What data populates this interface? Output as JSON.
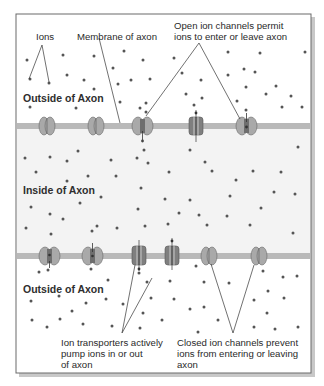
{
  "diagram": {
    "regions": {
      "outside_top": "Outside of Axon",
      "inside": "Inside of Axon",
      "outside_bottom": "Outside of Axon"
    },
    "labels": {
      "ions": "Ions",
      "membrane": "Membrane of axon",
      "open_channels_line1": "Open ion channels permit",
      "open_channels_line2": "ions to enter or leave axon",
      "transporters_line1": "Ion transporters actively",
      "transporters_line2": "pump ions in or out",
      "transporters_line3": "of axon",
      "closed_channels_line1": "Closed ion channels prevent",
      "closed_channels_line2": "ions from entering or leaving",
      "closed_channels_line3": "axon"
    },
    "top_membrane_proteins": [
      {
        "type": "closed-channel",
        "x": 47
      },
      {
        "type": "closed-channel",
        "x": 96
      },
      {
        "type": "open-channel",
        "x": 142
      },
      {
        "type": "ion-transporter",
        "x": 196
      },
      {
        "type": "open-channel",
        "x": 246
      }
    ],
    "bottom_membrane_proteins": [
      {
        "type": "open-channel",
        "x": 49
      },
      {
        "type": "open-channel",
        "x": 92
      },
      {
        "type": "ion-transporter",
        "x": 139
      },
      {
        "type": "ion-transporter",
        "x": 172
      },
      {
        "type": "closed-channel",
        "x": 209
      },
      {
        "type": "closed-channel",
        "x": 259
      }
    ],
    "colors": {
      "membrane": "#b9b9b9",
      "inside": "#f3f3f3",
      "channel": "#a9a9a9",
      "transporter": "#7f7f7f",
      "ion": "#555555",
      "frame": "#6a6a6a"
    }
  }
}
